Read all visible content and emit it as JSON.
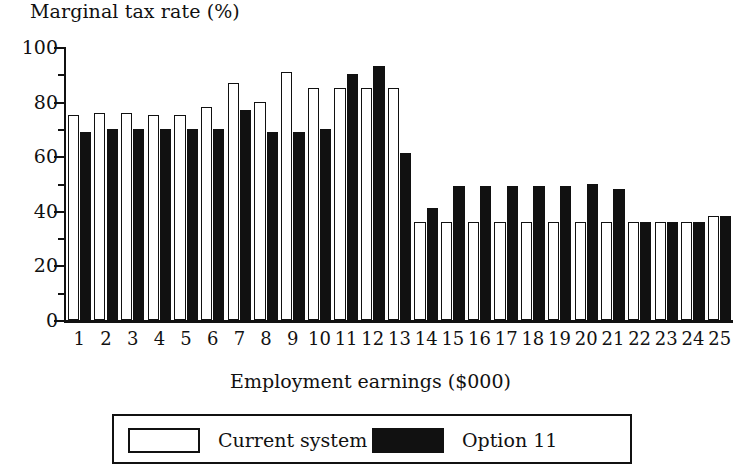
{
  "chart_data": {
    "type": "bar",
    "title": "Marginal tax rate (%)",
    "xlabel": "Employment earnings ($000)",
    "ylabel": "Marginal tax rate (%)",
    "ylim": [
      0,
      100
    ],
    "ytick_labels": [
      "100",
      "80",
      "60",
      "40",
      "20",
      "0"
    ],
    "ytick_values": [
      100,
      80,
      60,
      40,
      20,
      0
    ],
    "minor_ytick_values": [
      90,
      70,
      50,
      30,
      10
    ],
    "grid": false,
    "legend_position": "bottom",
    "categories": [
      "1",
      "2",
      "3",
      "4",
      "5",
      "6",
      "7",
      "8",
      "9",
      "10",
      "11",
      "12",
      "13",
      "14",
      "15",
      "16",
      "17",
      "18",
      "19",
      "20",
      "21",
      "22",
      "23",
      "24",
      "25"
    ],
    "series": [
      {
        "name": "Current system",
        "color": "#ffffff",
        "edge_color": "#111111",
        "values": [
          75,
          76,
          76,
          75,
          75,
          78,
          87,
          80,
          91,
          85,
          85,
          85,
          85,
          36,
          36,
          36,
          36,
          36,
          36,
          36,
          36,
          36,
          36,
          36,
          38
        ]
      },
      {
        "name": "Option 11",
        "color": "#111111",
        "edge_color": "#111111",
        "values": [
          69,
          70,
          70,
          70,
          70,
          70,
          77,
          69,
          69,
          70,
          90,
          93,
          61,
          41,
          49,
          49,
          49,
          49,
          49,
          50,
          48,
          36,
          36,
          36,
          38
        ]
      }
    ]
  },
  "legend": {
    "current_label": "Current system",
    "option_label": "Option 11"
  }
}
